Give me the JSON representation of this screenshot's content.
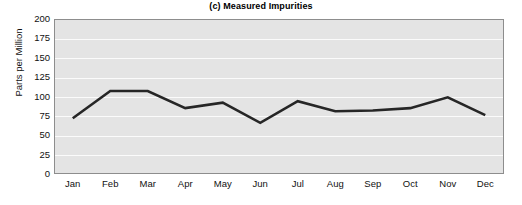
{
  "chart_data": {
    "type": "line",
    "title": "(c) Measured Impurities",
    "xlabel": "",
    "ylabel": "Parts per Million",
    "categories": [
      "Jan",
      "Feb",
      "Mar",
      "Apr",
      "May",
      "Jun",
      "Jul",
      "Aug",
      "Sep",
      "Oct",
      "Nov",
      "Dec"
    ],
    "values": [
      72,
      107,
      107,
      85,
      92,
      66,
      94,
      81,
      82,
      85,
      99,
      76
    ],
    "series": [
      {
        "name": "Measured Impurities",
        "values": [
          72,
          107,
          107,
          85,
          92,
          66,
          94,
          81,
          82,
          85,
          99,
          76
        ]
      }
    ],
    "ylim": [
      0,
      200
    ],
    "yticks": [
      0,
      25,
      50,
      75,
      100,
      125,
      150,
      175,
      200
    ],
    "ytick_labels": [
      "0",
      "25",
      "50",
      "75",
      "100",
      "125",
      "150",
      "175",
      "200"
    ],
    "grid": "horizontal",
    "legend": "none",
    "line_color": "#262626",
    "plot_background": "#e4e4e4",
    "gridline_color": "#fbfbfb",
    "frame_color": "#8d8d8d"
  }
}
